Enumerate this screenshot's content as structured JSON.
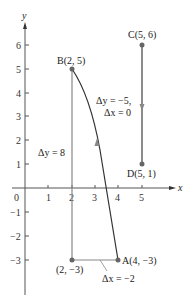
{
  "axes": {
    "x_label": "x",
    "y_label": "y",
    "origin_label": "0",
    "x_ticks": [
      "1",
      "2",
      "3",
      "4",
      "5"
    ],
    "y_ticks_pos": [
      "1",
      "2",
      "3",
      "4",
      "5",
      "6"
    ],
    "y_ticks_neg": [
      "−1",
      "−2",
      "−3"
    ]
  },
  "points": {
    "A": "A(4, −3)",
    "B": "B(2, 5)",
    "C": "C(5, 6)",
    "D": "D(5, 1)",
    "corner": "(2, −3)"
  },
  "annotations": {
    "delta_y_ab": "Δy = 8",
    "delta_x_ab": "Δx = −2",
    "delta_y_cd": "Δy = −5,",
    "delta_x_cd": "Δx = 0"
  },
  "colors": {
    "axis": "#555555",
    "segment": "#888888",
    "curve": "#333333",
    "point": "#666666"
  }
}
